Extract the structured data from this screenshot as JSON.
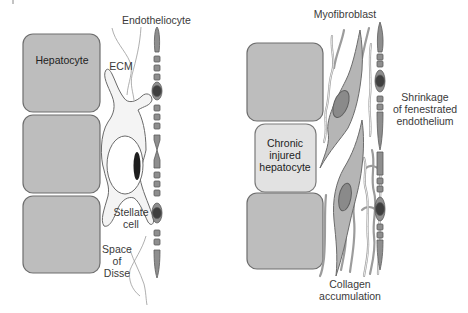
{
  "figure": {
    "left_panel": {
      "name": "Normal liver sinusoid",
      "labels": {
        "hepatocyte": "Hepatocyte",
        "ecm": "ECM",
        "endotheliocyte": "Endotheliocyte",
        "stellate_line1": "Stellate",
        "stellate_line2": "cell",
        "disse_line1": "Space",
        "disse_line2": "of",
        "disse_line3": "Disse"
      },
      "hepatocyte_count": 3
    },
    "right_panel": {
      "name": "Fibrotic liver sinusoid",
      "labels": {
        "myofibroblast": "Myofibroblast",
        "injured_line1": "Chronic",
        "injured_line2": "injured",
        "injured_line3": "hepatocyte",
        "shrink_line1": "Shrinkage",
        "shrink_line2": "of fenestrated",
        "shrink_line3": "endothelium",
        "collagen_line1": "Collagen",
        "collagen_line2": "accumulation"
      },
      "hepatocyte_count": 3
    },
    "colors": {
      "hepatocyte_fill": "#bdbdbd",
      "injured_hepatocyte_fill": "#e2e2e2",
      "endothelium_fill": "#8e8e8e",
      "nucleus_fill": "#3f3f3f",
      "stellate_fill": "#f4f4f4",
      "myofibroblast_fill": "#b5b5b5",
      "label_text": "#3a3a3a"
    }
  }
}
